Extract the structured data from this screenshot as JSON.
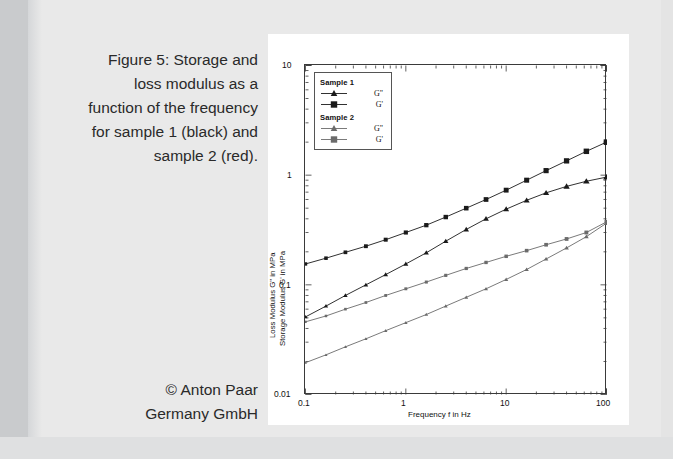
{
  "caption": {
    "lines": [
      "Figure 5: Storage and",
      "loss modulus as a",
      "function of the frequency",
      "for sample 1 (black) and",
      "sample 2 (red)."
    ],
    "full_text": "Figure 5: Storage and loss modulus as a function of the frequency for sample 1 (black) and sample 2 (red)."
  },
  "copyright": {
    "lines": [
      "© Anton Paar",
      "Germany GmbH"
    ],
    "full_text": "© Anton Paar Germany GmbH"
  },
  "legend": {
    "groups": [
      {
        "title": "Sample 1",
        "entries": [
          {
            "label": "G\"",
            "marker": "triangle",
            "color": "#1a1a1a"
          },
          {
            "label": "G'",
            "marker": "square",
            "color": "#1a1a1a"
          }
        ]
      },
      {
        "title": "Sample 2",
        "entries": [
          {
            "label": "G\"",
            "marker": "triangle",
            "color": "#6b6b6b"
          },
          {
            "label": "G'",
            "marker": "square",
            "color": "#6b6b6b"
          }
        ]
      }
    ]
  },
  "axes": {
    "x_title": "Frequency f in Hz",
    "y_title_line1": "Loss Modulus G\" in MPa",
    "y_title_line2": "Storage Modulus G' in MPa",
    "x_ticks": [
      "0.1",
      "1",
      "10",
      "100"
    ],
    "y_ticks": [
      "0.01",
      "0.1",
      "1",
      "10"
    ]
  },
  "chart_data": {
    "type": "line",
    "title": "Storage and loss modulus as a function of the frequency",
    "xlabel": "Frequency f in Hz",
    "ylabel": "Loss Modulus G\" in MPa / Storage Modulus G' in MPa",
    "xscale": "log",
    "yscale": "log",
    "xlim": [
      0.1,
      100
    ],
    "ylim": [
      0.01,
      10
    ],
    "grid": false,
    "legend_position": "top-left-inside",
    "x": [
      0.1,
      0.16,
      0.25,
      0.4,
      0.63,
      1.0,
      1.6,
      2.5,
      4.0,
      6.3,
      10.0,
      16.0,
      25.0,
      40.0,
      63.0,
      100.0
    ],
    "series": [
      {
        "name": "Sample 1 G'",
        "label": "G'",
        "group": "Sample 1",
        "marker": "square",
        "color": "#1a1a1a",
        "values": [
          0.155,
          0.175,
          0.198,
          0.225,
          0.258,
          0.3,
          0.35,
          0.415,
          0.5,
          0.6,
          0.73,
          0.9,
          1.1,
          1.35,
          1.65,
          2.0
        ]
      },
      {
        "name": "Sample 1 G\"",
        "label": "G\"",
        "group": "Sample 1",
        "marker": "triangle",
        "color": "#1a1a1a",
        "values": [
          0.051,
          0.064,
          0.08,
          0.1,
          0.124,
          0.155,
          0.196,
          0.25,
          0.32,
          0.4,
          0.49,
          0.59,
          0.69,
          0.79,
          0.88,
          0.96
        ]
      },
      {
        "name": "Sample 2 G'",
        "label": "G'",
        "group": "Sample 2",
        "marker": "square",
        "color": "#6b6b6b",
        "values": [
          0.046,
          0.052,
          0.06,
          0.069,
          0.08,
          0.092,
          0.106,
          0.122,
          0.141,
          0.16,
          0.182,
          0.205,
          0.232,
          0.262,
          0.3,
          0.375
        ]
      },
      {
        "name": "Sample 2 G\"",
        "label": "G\"",
        "group": "Sample 2",
        "marker": "triangle",
        "color": "#6b6b6b",
        "values": [
          0.0195,
          0.023,
          0.0272,
          0.0322,
          0.0382,
          0.0452,
          0.0536,
          0.064,
          0.077,
          0.092,
          0.112,
          0.138,
          0.172,
          0.217,
          0.275,
          0.365
        ]
      }
    ]
  },
  "colors": {
    "page_background": "#e9e9e9",
    "panel_background": "#ffffff",
    "axis": "#3a3a3a",
    "sample1": "#1a1a1a",
    "sample2": "#6b6b6b",
    "text": "#2a2a2a"
  }
}
